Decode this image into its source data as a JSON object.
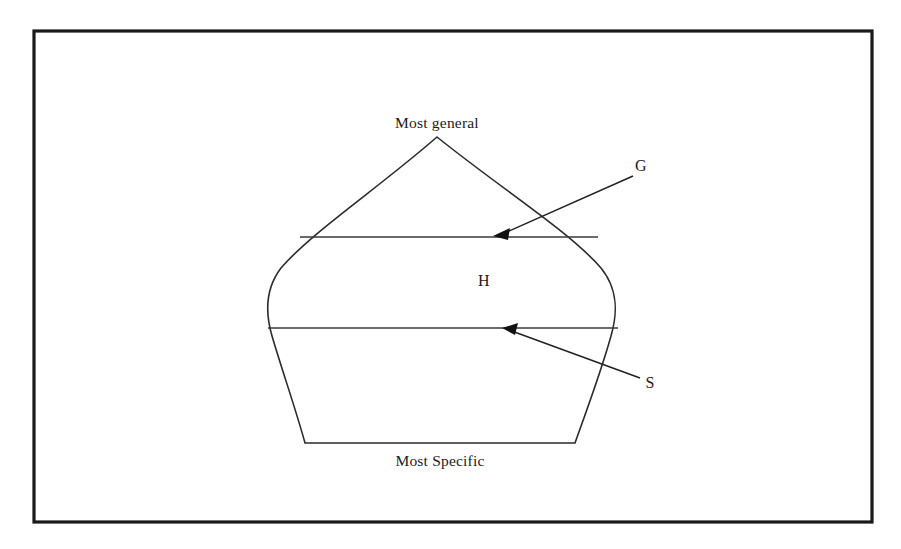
{
  "figure": {
    "caption_labels": {
      "top": "Most general",
      "bottom": "Most Specific",
      "region": "H",
      "general_boundary": "G",
      "specific_boundary": "S"
    },
    "colors": {
      "frame": "#1a1a1a",
      "outline": "#2b2b2b",
      "boundary": "#3a3a3a",
      "leader": "#222222",
      "background": "#ffffff",
      "text": "#1b1b1b"
    },
    "geometry": {
      "frame": {
        "x": 34,
        "y": 31,
        "width": 838,
        "height": 491
      },
      "apex": {
        "x": 437,
        "y": 137
      },
      "g_line": {
        "x1": 300,
        "y1": 237,
        "x2": 598,
        "y2": 237
      },
      "s_line": {
        "x1": 268,
        "y1": 328,
        "x2": 618,
        "y2": 328
      },
      "bottom_line": {
        "x1": 305,
        "y1": 443,
        "x2": 575,
        "y2": 443
      },
      "g_arrow_tip": {
        "x": 494,
        "y": 236
      },
      "s_arrow_tip": {
        "x": 503,
        "y": 328
      }
    }
  }
}
